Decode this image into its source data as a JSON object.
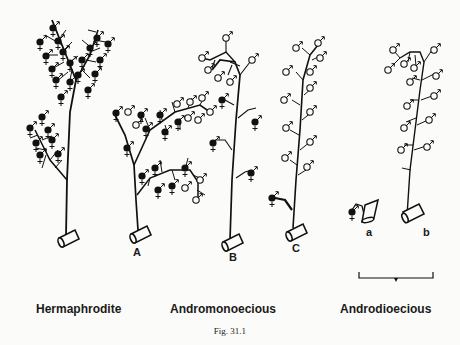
{
  "figure": {
    "caption": "Fig. 31.1",
    "categories": [
      {
        "id": "hermaphrodite",
        "label": "Hermaphrodite"
      },
      {
        "id": "andromonoecious",
        "label": "Andromonoecious"
      },
      {
        "id": "androdioecious",
        "label": "Androdioecious"
      }
    ],
    "plant_labels": {
      "A": "A",
      "B": "B",
      "C": "C",
      "a": "a",
      "b": "b"
    },
    "symbols": {
      "hermaphrodite_flower": "filled circle with ♂ arrow and ♀ cross",
      "male_flower": "open circle with ♂ arrow"
    },
    "colors": {
      "ink": "#111111",
      "paper": "#fbfbf9"
    }
  }
}
